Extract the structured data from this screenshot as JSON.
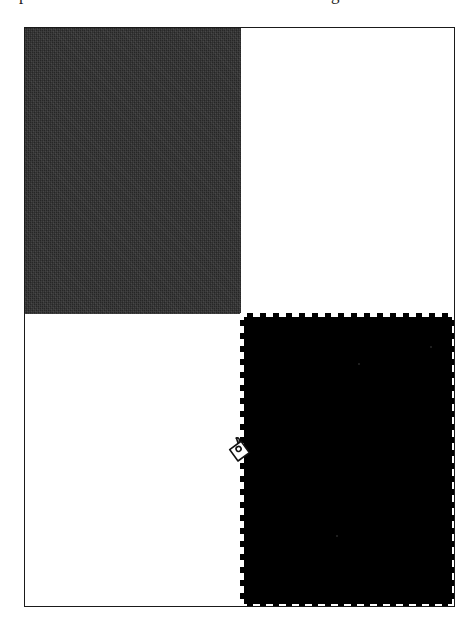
{
  "page": {
    "kind": "scanned-figure-page",
    "background_color": "#ffffff",
    "width_px": 476,
    "height_px": 632
  },
  "clipped_text": {
    "note": "bottom descenders of a text line cropped off the top of the scan",
    "left_fragment": "p",
    "right_fragment": "g"
  },
  "frame": {
    "name": "figure-border",
    "border_color": "#1a1a1a",
    "border_width_px": 1,
    "fill_color": "#ffffff",
    "left_px": 24,
    "top_px": 27,
    "width_px": 431,
    "height_px": 580
  },
  "shapes": [
    {
      "id": "rect-dark-gray",
      "label": "dark textured rectangle",
      "position": "top-left",
      "fill_color": "#262626",
      "texture": "dithered-noise",
      "selected": false,
      "left_px": 0,
      "top_px": 0,
      "width_px": 216,
      "height_px": 286
    },
    {
      "id": "rect-black-selected",
      "label": "black rectangle",
      "position": "bottom-right",
      "fill_color": "#000000",
      "texture": "solid",
      "selected": true,
      "selection_style": "dashed-marquee",
      "selection_color": "#ffffff",
      "dash_length_px": 7,
      "dash_gap_px": 6,
      "left_px": 215,
      "top_px": 285,
      "width_px": 216,
      "height_px": 295
    }
  ],
  "cursor": {
    "name": "grab-hand-cursor",
    "style": "hand",
    "stroke_color": "#111111",
    "fill_color": "#ffffff",
    "x_px": 198,
    "y_px": 407
  }
}
